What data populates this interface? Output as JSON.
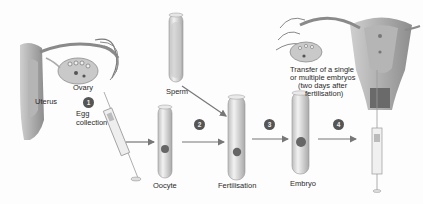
{
  "diagram": {
    "labels": {
      "uterus": "Uterus",
      "ovary": "Ovary",
      "egg_collection": "Egg collection",
      "sperm": "Sperm",
      "oocyte": "Oocyte",
      "fertilisation": "Fertilisation",
      "embryo": "Embryo",
      "transfer_line1": "Transfer of a single",
      "transfer_line2": "or multiple embryos",
      "transfer_line3": "(two days after",
      "transfer_line4": "fertilisation)"
    },
    "steps": [
      {
        "number": "1",
        "label": "Egg collection"
      },
      {
        "number": "2",
        "label": "Fertilisation"
      },
      {
        "number": "3",
        "label": "Embryo"
      },
      {
        "number": "4",
        "label": "Transfer"
      }
    ],
    "colors": {
      "ink": "#2a2a2a",
      "tissue": "#9a9a9a",
      "tube": "#d8d8d8",
      "badge": "#555555",
      "arrow": "#777777"
    }
  }
}
